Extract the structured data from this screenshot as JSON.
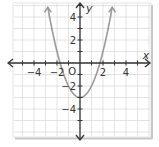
{
  "chart_data": {
    "type": "line",
    "title": "",
    "xlabel": "x",
    "ylabel": "y",
    "origin_label": "O",
    "xlim": [
      -6,
      6
    ],
    "ylim": [
      -6,
      5
    ],
    "grid": true,
    "x_ticks": [
      -4,
      -2,
      2,
      4
    ],
    "y_ticks": [
      4,
      2,
      -2,
      -4
    ],
    "x_tick_labels": [
      "−4",
      "−2",
      "2",
      "4"
    ],
    "y_tick_labels": [
      "4",
      "2",
      "−2",
      "−4"
    ],
    "series": [
      {
        "name": "y = x² − 3",
        "equation": "y = x^2 - 3",
        "color": "#9a9a9a",
        "x": [
          -2.8,
          -2.5,
          -2,
          -1.5,
          -1,
          -0.5,
          0,
          0.5,
          1,
          1.5,
          2,
          2.5,
          2.8
        ],
        "y": [
          4.84,
          3.25,
          1,
          -0.75,
          -2,
          -2.75,
          -3,
          -2.75,
          -2,
          -0.75,
          1,
          3.25,
          4.84
        ]
      }
    ],
    "vertex": [
      0,
      -3
    ],
    "x_intercepts": [
      -1.73,
      1.73
    ]
  },
  "colors": {
    "grid": "#dcdcdc",
    "axis": "#333333",
    "curve": "#9a9a9a",
    "border": "#c8c8c8"
  }
}
